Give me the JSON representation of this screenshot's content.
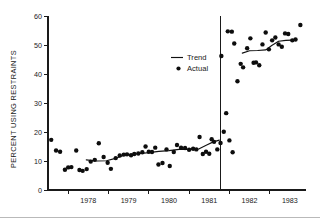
{
  "chart_data": {
    "type": "scatter",
    "title": "",
    "xlabel": "",
    "ylabel": "PERCENT USING RESTRAINTS",
    "xlim": [
      1977.5,
      1983.9
    ],
    "ylim": [
      0,
      60
    ],
    "yticks": [
      0,
      10,
      20,
      30,
      40,
      50,
      60
    ],
    "ytick_labels": [
      "0",
      "10",
      "20",
      "30",
      "40",
      "50",
      "60"
    ],
    "xtick_labels": [
      "1978",
      "1979",
      "1980",
      "1981",
      "1982",
      "1983"
    ],
    "xtick_values": [
      1978,
      1979,
      1980,
      1981,
      1982,
      1983
    ],
    "grid": false,
    "legend_position": "upper-center",
    "legend": [
      {
        "label": "Trend",
        "marker": "line"
      },
      {
        "label": "Actual",
        "marker": "dot"
      }
    ],
    "annotations": [
      {
        "type": "vertical-line",
        "x": 1981.78,
        "label": "intervention-divider"
      }
    ],
    "series": [
      {
        "name": "Actual",
        "marker": "dot",
        "points": [
          [
            1977.58,
            17.3
          ],
          [
            1977.7,
            13.6
          ],
          [
            1977.8,
            13.2
          ],
          [
            1977.92,
            7.0
          ],
          [
            1978.0,
            7.8
          ],
          [
            1978.08,
            7.9
          ],
          [
            1978.2,
            13.6
          ],
          [
            1978.28,
            6.9
          ],
          [
            1978.36,
            6.6
          ],
          [
            1978.46,
            7.2
          ],
          [
            1978.56,
            9.8
          ],
          [
            1978.66,
            10.4
          ],
          [
            1978.76,
            16.1
          ],
          [
            1978.88,
            11.4
          ],
          [
            1978.98,
            9.4
          ],
          [
            1979.06,
            7.3
          ],
          [
            1979.18,
            11.0
          ],
          [
            1979.28,
            11.9
          ],
          [
            1979.38,
            12.2
          ],
          [
            1979.46,
            12.3
          ],
          [
            1979.56,
            12.0
          ],
          [
            1979.64,
            12.4
          ],
          [
            1979.74,
            12.6
          ],
          [
            1979.84,
            13.0
          ],
          [
            1979.92,
            15.0
          ],
          [
            1980.0,
            13.2
          ],
          [
            1980.08,
            13.1
          ],
          [
            1980.16,
            14.6
          ],
          [
            1980.24,
            8.8
          ],
          [
            1980.34,
            9.3
          ],
          [
            1980.44,
            14.0
          ],
          [
            1980.52,
            8.3
          ],
          [
            1980.62,
            13.1
          ],
          [
            1980.7,
            15.5
          ],
          [
            1980.8,
            14.6
          ],
          [
            1980.9,
            14.5
          ],
          [
            1981.0,
            13.9
          ],
          [
            1981.1,
            14.2
          ],
          [
            1981.18,
            14.0
          ],
          [
            1981.26,
            18.3
          ],
          [
            1981.34,
            12.4
          ],
          [
            1981.42,
            13.2
          ],
          [
            1981.5,
            12.5
          ],
          [
            1981.56,
            17.5
          ],
          [
            1981.62,
            16.6
          ],
          [
            1981.7,
            14.0
          ],
          [
            1981.78,
            16.2
          ],
          [
            1981.86,
            20.1
          ],
          [
            1981.92,
            26.5
          ],
          [
            1982.0,
            17.1
          ],
          [
            1982.08,
            13.0
          ],
          [
            1981.8,
            46.2
          ],
          [
            1981.96,
            54.7
          ],
          [
            1982.06,
            54.6
          ],
          [
            1982.12,
            50.5
          ],
          [
            1982.2,
            37.5
          ],
          [
            1982.28,
            43.5
          ],
          [
            1982.34,
            42.3
          ],
          [
            1982.44,
            48.9
          ],
          [
            1982.52,
            52.3
          ],
          [
            1982.6,
            43.9
          ],
          [
            1982.66,
            44.0
          ],
          [
            1982.74,
            43.0
          ],
          [
            1982.82,
            50.2
          ],
          [
            1982.9,
            54.3
          ],
          [
            1982.98,
            48.5
          ],
          [
            1983.06,
            51.6
          ],
          [
            1983.14,
            52.6
          ],
          [
            1983.22,
            50.2
          ],
          [
            1983.3,
            49.4
          ],
          [
            1983.38,
            54.0
          ],
          [
            1983.46,
            53.8
          ],
          [
            1983.56,
            51.6
          ],
          [
            1983.64,
            51.9
          ],
          [
            1983.76,
            56.9
          ]
        ]
      },
      {
        "name": "Trend",
        "marker": "line",
        "segment": "pre",
        "points": [
          [
            1978.45,
            10.4
          ],
          [
            1978.7,
            10.0
          ],
          [
            1978.95,
            10.1
          ],
          [
            1979.15,
            10.8
          ],
          [
            1979.35,
            11.8
          ],
          [
            1979.52,
            12.2
          ],
          [
            1979.75,
            12.5
          ],
          [
            1980.0,
            12.9
          ],
          [
            1980.25,
            13.3
          ],
          [
            1980.5,
            13.6
          ],
          [
            1980.75,
            14.0
          ],
          [
            1981.0,
            14.0
          ],
          [
            1981.25,
            14.2
          ],
          [
            1981.45,
            15.6
          ],
          [
            1981.6,
            16.6
          ],
          [
            1981.75,
            17.2
          ]
        ]
      },
      {
        "name": "Trend",
        "marker": "line",
        "segment": "post",
        "points": [
          [
            1982.32,
            47.2
          ],
          [
            1982.5,
            48.0
          ],
          [
            1982.7,
            48.1
          ],
          [
            1982.9,
            48.3
          ],
          [
            1983.05,
            49.8
          ],
          [
            1983.22,
            51.3
          ],
          [
            1983.4,
            51.6
          ],
          [
            1983.55,
            51.7
          ]
        ]
      }
    ]
  }
}
